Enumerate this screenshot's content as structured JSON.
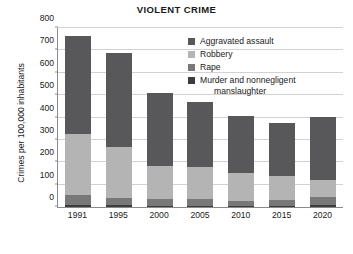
{
  "chart_data": {
    "type": "bar",
    "subtype": "stacked-vertical",
    "title": "VIOLENT CRIME",
    "xlabel": "",
    "ylabel": "Crimes per 100,000 inhabitants",
    "categories": [
      "1991",
      "1995",
      "2000",
      "2005",
      "2010",
      "2015",
      "2020"
    ],
    "ylim": [
      0,
      800
    ],
    "yticks": [
      0,
      100,
      200,
      300,
      400,
      500,
      600,
      700,
      800
    ],
    "ytick_labels": [
      "0",
      "100",
      "200",
      "300",
      "400",
      "500",
      "600",
      "700",
      "800"
    ],
    "grid": true,
    "legend_position": "upper-right-inside",
    "stack_order_bottom_to_top": [
      "Murder and nonnegligent manslaughter",
      "Rape",
      "Robbery",
      "Aggravated assault"
    ],
    "series": [
      {
        "name": "Aggravated assault",
        "color": "#58585a",
        "values": [
          433,
          420,
          325,
          291,
          254,
          235,
          280
        ]
      },
      {
        "name": "Robbery",
        "color": "#b4b4b4",
        "values": [
          273,
          223,
          145,
          141,
          123,
          108,
          75
        ]
      },
      {
        "name": "Rape",
        "color": "#787878",
        "values": [
          42,
          34,
          31,
          31,
          23,
          25,
          37
        ]
      },
      {
        "name": "Murder and nonnegligent manslaughter",
        "color": "#3c3c3e",
        "values": [
          10,
          8,
          6,
          6,
          5,
          5,
          7
        ]
      }
    ],
    "totals": [
      758,
      685,
      507,
      469,
      405,
      373,
      399
    ]
  },
  "legend": {
    "items": [
      {
        "label": "Aggravated assault",
        "continuation": ""
      },
      {
        "label": "Robbery",
        "continuation": ""
      },
      {
        "label": "Rape",
        "continuation": ""
      },
      {
        "label": "Murder and nonnegligent",
        "continuation": "manslaughter"
      }
    ]
  }
}
